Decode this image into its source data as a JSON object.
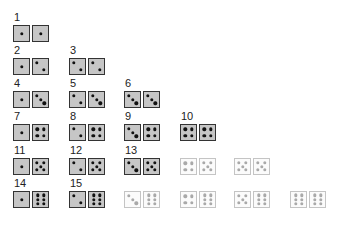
{
  "colors": {
    "active_fill": "#c6c6c6",
    "active_border": "#333333",
    "faded_fill": "#fbfbfb",
    "faded_border": "#c4c4c4"
  },
  "columns_x": [
    13,
    69,
    124,
    180,
    234,
    290
  ],
  "rows_y": [
    13,
    46,
    79,
    112,
    146,
    179
  ],
  "pairs": [
    {
      "label": "1",
      "a": 1,
      "b": 1,
      "row": 0,
      "col": 0,
      "active": true
    },
    {
      "label": "2",
      "a": 1,
      "b": 2,
      "row": 1,
      "col": 0,
      "active": true
    },
    {
      "label": "3",
      "a": 2,
      "b": 2,
      "row": 1,
      "col": 1,
      "active": true
    },
    {
      "label": "4",
      "a": 1,
      "b": 3,
      "row": 2,
      "col": 0,
      "active": true
    },
    {
      "label": "5",
      "a": 2,
      "b": 3,
      "row": 2,
      "col": 1,
      "active": true
    },
    {
      "label": "6",
      "a": 3,
      "b": 3,
      "row": 2,
      "col": 2,
      "active": true
    },
    {
      "label": "7",
      "a": 1,
      "b": 4,
      "row": 3,
      "col": 0,
      "active": true
    },
    {
      "label": "8",
      "a": 2,
      "b": 4,
      "row": 3,
      "col": 1,
      "active": true
    },
    {
      "label": "9",
      "a": 3,
      "b": 4,
      "row": 3,
      "col": 2,
      "active": true
    },
    {
      "label": "10",
      "a": 4,
      "b": 4,
      "row": 3,
      "col": 3,
      "active": true
    },
    {
      "label": "11",
      "a": 1,
      "b": 5,
      "row": 4,
      "col": 0,
      "active": true
    },
    {
      "label": "12",
      "a": 2,
      "b": 5,
      "row": 4,
      "col": 1,
      "active": true
    },
    {
      "label": "13",
      "a": 3,
      "b": 5,
      "row": 4,
      "col": 2,
      "active": true
    },
    {
      "label": "",
      "a": 4,
      "b": 5,
      "row": 4,
      "col": 3,
      "active": false
    },
    {
      "label": "",
      "a": 5,
      "b": 5,
      "row": 4,
      "col": 4,
      "active": false
    },
    {
      "label": "14",
      "a": 1,
      "b": 6,
      "row": 5,
      "col": 0,
      "active": true
    },
    {
      "label": "15",
      "a": 2,
      "b": 6,
      "row": 5,
      "col": 1,
      "active": true
    },
    {
      "label": "",
      "a": 3,
      "b": 6,
      "row": 5,
      "col": 2,
      "active": false
    },
    {
      "label": "",
      "a": 4,
      "b": 6,
      "row": 5,
      "col": 3,
      "active": false
    },
    {
      "label": "",
      "a": 5,
      "b": 6,
      "row": 5,
      "col": 4,
      "active": false
    },
    {
      "label": "",
      "a": 6,
      "b": 6,
      "row": 5,
      "col": 5,
      "active": false
    }
  ]
}
